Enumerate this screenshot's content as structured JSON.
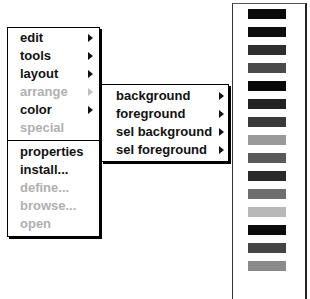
{
  "main_menu": {
    "items": [
      {
        "label": "edit",
        "enabled": true,
        "submenu": true
      },
      {
        "label": "tools",
        "enabled": true,
        "submenu": true
      },
      {
        "label": "layout",
        "enabled": true,
        "submenu": true
      },
      {
        "label": "arrange",
        "enabled": false,
        "submenu": true
      },
      {
        "label": "color",
        "enabled": true,
        "submenu": true
      },
      {
        "label": "special",
        "enabled": false,
        "submenu": false
      }
    ],
    "items2": [
      {
        "label": "properties",
        "enabled": true
      },
      {
        "label": "install...",
        "enabled": true
      },
      {
        "label": "define...",
        "enabled": false
      },
      {
        "label": "browse...",
        "enabled": false
      },
      {
        "label": "open",
        "enabled": false
      }
    ]
  },
  "color_submenu": {
    "items": [
      {
        "label": "background"
      },
      {
        "label": "foreground"
      },
      {
        "label": "sel background"
      },
      {
        "label": "sel foreground"
      }
    ]
  },
  "palette": {
    "swatches": [
      "#0a0a0a",
      "#0d0d0d",
      "#2e2e2e",
      "#4a4a4a",
      "#080808",
      "#222222",
      "#3a3a3a",
      "#9a9a9a",
      "#5a5a5a",
      "#2a2a2a",
      "#6e6e6e",
      "#b8b8b8",
      "#0c0c0c",
      "#444444",
      "#8a8a8a"
    ]
  }
}
